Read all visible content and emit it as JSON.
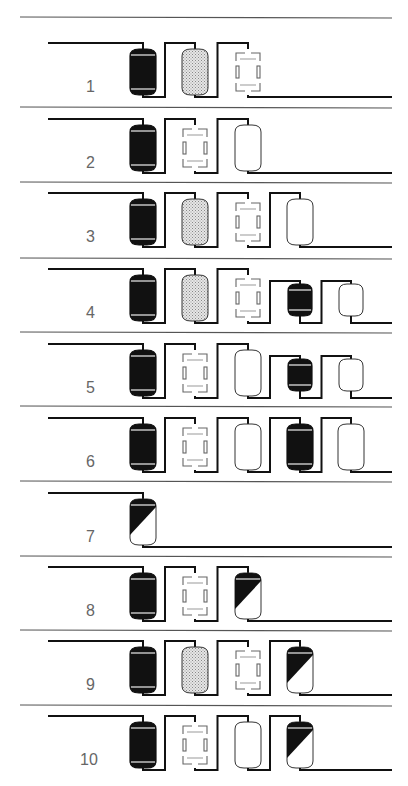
{
  "diagram": {
    "legend_types": {
      "cation": "black filled vessel (strong acid cation)",
      "anion_weak": "stippled vessel",
      "degasifier": "dashed rectangle (degasser)",
      "anion": "white vessel",
      "mixed_bed": "diagonally split black/white vessel"
    },
    "rows": [
      {
        "label": "1",
        "units": [
          {
            "type": "cation",
            "size": "L"
          },
          {
            "type": "stipple",
            "size": "L"
          },
          {
            "type": "degas",
            "size": "L"
          }
        ]
      },
      {
        "label": "2",
        "units": [
          {
            "type": "cation",
            "size": "L"
          },
          {
            "type": "degas",
            "size": "L"
          },
          {
            "type": "anion",
            "size": "L"
          }
        ]
      },
      {
        "label": "3",
        "units": [
          {
            "type": "cation",
            "size": "L"
          },
          {
            "type": "stipple",
            "size": "L"
          },
          {
            "type": "degas",
            "size": "L"
          },
          {
            "type": "anion",
            "size": "L"
          }
        ]
      },
      {
        "label": "4",
        "units": [
          {
            "type": "cation",
            "size": "L"
          },
          {
            "type": "stipple",
            "size": "L"
          },
          {
            "type": "degas",
            "size": "L"
          },
          {
            "type": "cation",
            "size": "S"
          },
          {
            "type": "anion",
            "size": "S"
          }
        ]
      },
      {
        "label": "5",
        "units": [
          {
            "type": "cation",
            "size": "L"
          },
          {
            "type": "degas",
            "size": "L"
          },
          {
            "type": "anion",
            "size": "L"
          },
          {
            "type": "cation",
            "size": "S"
          },
          {
            "type": "anion",
            "size": "S"
          }
        ]
      },
      {
        "label": "6",
        "units": [
          {
            "type": "cation",
            "size": "L"
          },
          {
            "type": "degas",
            "size": "L"
          },
          {
            "type": "anion",
            "size": "L"
          },
          {
            "type": "cation",
            "size": "L"
          },
          {
            "type": "anion",
            "size": "L"
          }
        ]
      },
      {
        "label": "7",
        "units": [
          {
            "type": "mixed",
            "size": "L"
          }
        ]
      },
      {
        "label": "8",
        "units": [
          {
            "type": "cation",
            "size": "L"
          },
          {
            "type": "degas",
            "size": "L"
          },
          {
            "type": "mixed",
            "size": "L"
          }
        ]
      },
      {
        "label": "9",
        "units": [
          {
            "type": "cation",
            "size": "L"
          },
          {
            "type": "stipple",
            "size": "L"
          },
          {
            "type": "degas",
            "size": "L"
          },
          {
            "type": "mixed",
            "size": "L"
          }
        ]
      },
      {
        "label": "10",
        "units": [
          {
            "type": "cation",
            "size": "L"
          },
          {
            "type": "degas",
            "size": "L"
          },
          {
            "type": "anion",
            "size": "L"
          },
          {
            "type": "mixed",
            "size": "L"
          }
        ]
      }
    ],
    "colors": {
      "ink": "#111111",
      "separator": "#555555",
      "label": "#666666",
      "stipple": "#c8c8c8"
    }
  }
}
